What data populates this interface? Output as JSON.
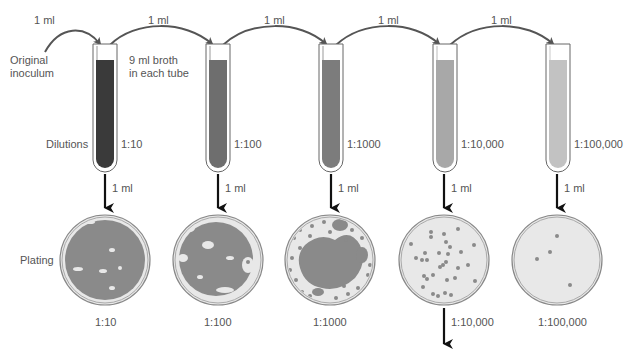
{
  "diagram": {
    "transfer_volume": "1 ml",
    "original_inoculum_label": [
      "Original",
      "inoculum"
    ],
    "broth_note": [
      "9 ml broth",
      "in each tube"
    ],
    "dilutions_row_label": "Dilutions",
    "plating_row_label": "Plating",
    "tubes": [
      {
        "dilution": "1:10",
        "liquid_color": "#3a3a3a",
        "x": 93
      },
      {
        "dilution": "1:100",
        "liquid_color": "#6e6e6e",
        "x": 206
      },
      {
        "dilution": "1:1000",
        "liquid_color": "#7c7c7c",
        "x": 319
      },
      {
        "dilution": "1:10,000",
        "liquid_color": "#a8a8a8",
        "x": 433
      },
      {
        "dilution": "1:100,000",
        "liquid_color": "#c2c2c2",
        "x": 546
      }
    ],
    "plates": [
      {
        "dilution": "1:10",
        "growth": "confluent"
      },
      {
        "dilution": "1:100",
        "growth": "nearly confluent"
      },
      {
        "dilution": "1:1000",
        "growth": "dense colonies"
      },
      {
        "dilution": "1:10,000",
        "growth": "countable colonies"
      },
      {
        "dilution": "1:100,000",
        "growth": "few colonies"
      }
    ],
    "transfer_labels": [
      "1 ml",
      "1 ml",
      "1 ml",
      "1 ml",
      "1 ml"
    ],
    "plate_transfer_labels": [
      "1 ml",
      "1 ml",
      "1 ml",
      "1 ml",
      "1 ml"
    ],
    "colors": {
      "arrow": "#555555",
      "plate_rim": "#888888",
      "plate_agar": "#e6e6e6",
      "colony": "#8a8a8a",
      "down_arrow": "#111111"
    }
  }
}
